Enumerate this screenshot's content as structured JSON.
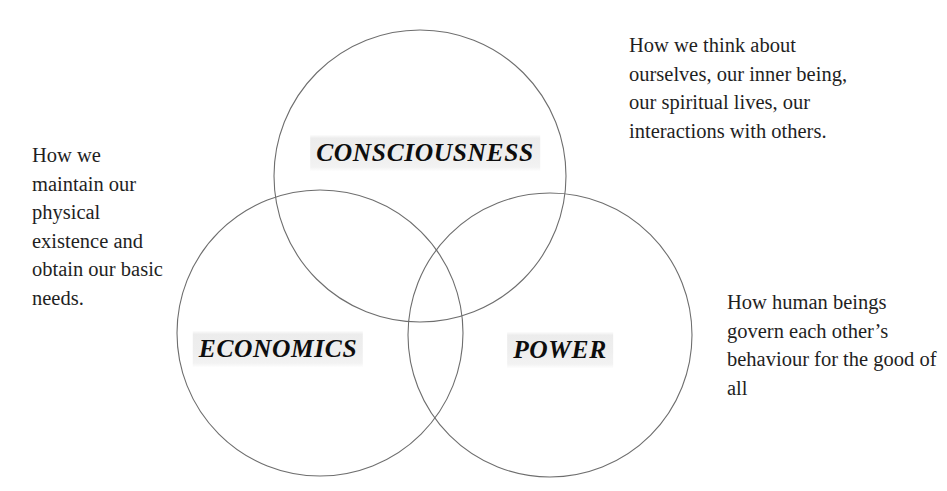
{
  "diagram": {
    "type": "venn",
    "background_color": "#ffffff",
    "stroke_color": "#6e6e6e",
    "label_highlight_color": "#ececec",
    "text_color": "#1f1f1f",
    "circles": [
      {
        "id": "consciousness",
        "label": "CONSCIOUSNESS",
        "cx": 420,
        "cy": 176,
        "r": 146
      },
      {
        "id": "economics",
        "label": "ECONOMICS",
        "cx": 320,
        "cy": 333,
        "r": 143
      },
      {
        "id": "power",
        "label": "POWER",
        "cx": 550,
        "cy": 335,
        "r": 142
      }
    ],
    "descriptions": {
      "economics": "How we maintain our physical existence and obtain our basic needs.",
      "consciousness": "How we think about ourselves, our inner being, our spiritual lives, our interactions with others.",
      "power": "How human beings govern each other’s behaviour for the good of all"
    }
  }
}
